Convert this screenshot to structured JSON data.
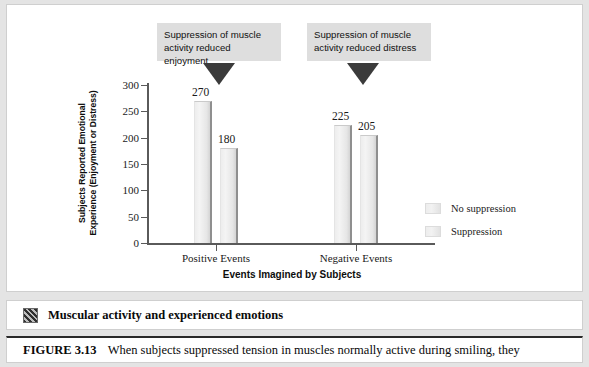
{
  "chart_data": {
    "type": "bar",
    "title": "",
    "categories": [
      "Positive Events",
      "Negative Events"
    ],
    "series": [
      {
        "name": "No suppression",
        "values": [
          270,
          225
        ]
      },
      {
        "name": "Suppression",
        "values": [
          180,
          205
        ]
      }
    ],
    "xlabel": "Events Imagined by Subjects",
    "ylabel": "Subjects Reported Emotional Experience (Enjoyment or Distress)",
    "ylim": [
      0,
      300
    ],
    "yticks": [
      0,
      50,
      100,
      150,
      200,
      250,
      300
    ],
    "ytick_labels": [
      "0",
      "50",
      "100",
      "150",
      "200",
      "250",
      "300"
    ],
    "grid": false,
    "legend_position": "right",
    "bar_color": "#ededed",
    "bar_edge_color": "#8f8f8f",
    "axis_color": "#5a5a5a"
  },
  "ylabel_lines": [
    "Subjects Reported Emotional",
    "Experience (Enjoyment or Distress)"
  ],
  "annotations": [
    {
      "id": "callout-positive",
      "lines": [
        "Suppression of muscle",
        "activity reduced enjoyment"
      ],
      "background": "#dedede",
      "arrow": "down-triangle"
    },
    {
      "id": "callout-negative",
      "lines": [
        "Suppression of muscle",
        "activity reduced distress"
      ],
      "background": "#dedede",
      "arrow": "down-triangle"
    }
  ],
  "icon_row": {
    "icon": "thumbnail-icon",
    "text": "Muscular activity and experienced emotions"
  },
  "caption": {
    "figure_number": "FIGURE 3.13",
    "text": "When subjects suppressed tension in muscles normally active during smiling, they"
  }
}
